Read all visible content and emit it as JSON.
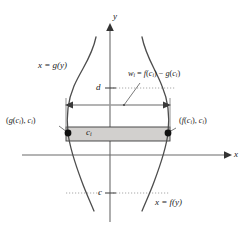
{
  "figure": {
    "background_color": "#ffffff",
    "axes": {
      "x_axis_label": "x",
      "y_axis_label": "y",
      "x_axis_y_px": 155,
      "y_axis_x_px": 110,
      "x_axis_start_px": 22,
      "x_axis_end_px": 228,
      "y_axis_top_px": 22,
      "y_axis_bottom_px": 222
    },
    "curves": [
      {
        "name": "left-curve",
        "label": "x = g(y)",
        "label_x_px": 38,
        "label_y_px": 66,
        "color": "#4d4d4d"
      },
      {
        "name": "right-curve",
        "label": "x = f(y)",
        "label_x_px": 155,
        "label_y_px": 203,
        "color": "#4d4d4d"
      }
    ],
    "ticks": [
      {
        "name": "tick-d",
        "label": "d",
        "axis": "y",
        "x_px": 99,
        "y_px": 88,
        "dotted": true
      },
      {
        "name": "tick-c",
        "label": "c",
        "axis": "y",
        "x_px": 101,
        "y_px": 193,
        "dotted": true
      },
      {
        "name": "tick-ci",
        "label": "c",
        "sub": "i",
        "axis": "y",
        "x_px": 88,
        "y_px": 133,
        "dotted": false
      }
    ],
    "rectangle": {
      "name": "representative-rectangle",
      "fill_color": "#d2d0ce",
      "stroke_color": "#3a3a3a",
      "left_px": 66,
      "right_px": 170,
      "top_px": 127,
      "bottom_px": 141
    },
    "points": [
      {
        "name": "left-intersection-point",
        "label": "(g(c_i), c_i)",
        "label_parts": {
          "open": "(",
          "fn": "g",
          "arg_open": "(",
          "arg": "c",
          "arg_sub": "i",
          "arg_close": ")",
          "sep": ", ",
          "second": "c",
          "second_sub": "i",
          "close": ")"
        },
        "x_px": 68,
        "y_px": 133,
        "label_x_px": 8,
        "label_y_px": 122
      },
      {
        "name": "right-intersection-point",
        "label": "(f(c_i), c_i)",
        "label_parts": {
          "open": "(",
          "fn": "f",
          "arg_open": "(",
          "arg": "c",
          "arg_sub": "i",
          "arg_close": ")",
          "sep": ", ",
          "second": "c",
          "second_sub": "i",
          "close": ")"
        },
        "x_px": 168,
        "y_px": 133,
        "label_x_px": 176,
        "label_y_px": 122
      }
    ],
    "width_annotation": {
      "name": "width-annotation",
      "text": "w_i = f(c_i) - g(c_i)",
      "parts": {
        "w": "w",
        "w_sub": "i",
        "equals": " = ",
        "f": "f",
        "f_arg_open": "(",
        "f_arg": "c",
        "f_arg_sub": "i",
        "f_arg_close": ")",
        "minus": " − ",
        "g": "g",
        "g_arg_open": "(",
        "g_arg": "c",
        "g_arg_sub": "i",
        "g_arg_close": ")"
      },
      "label_x_px": 140,
      "label_y_px": 76,
      "arrow_y_px": 105,
      "arrow_left_px": 66,
      "arrow_right_px": 170,
      "arrow_color": "#9a9a9a",
      "leader_from_x_px": 139,
      "leader_from_y_px": 84,
      "leader_to_x_px": 124,
      "leader_to_y_px": 105
    },
    "colors": {
      "curve": "#4d4d4d",
      "axis": "#6b6b6b",
      "rectangle_fill": "#d2d0ce",
      "rectangle_stroke": "#3a3a3a",
      "dotted_guide": "#9a9a9a",
      "text": "#1a1a1a",
      "point_dot": "#111111"
    }
  }
}
